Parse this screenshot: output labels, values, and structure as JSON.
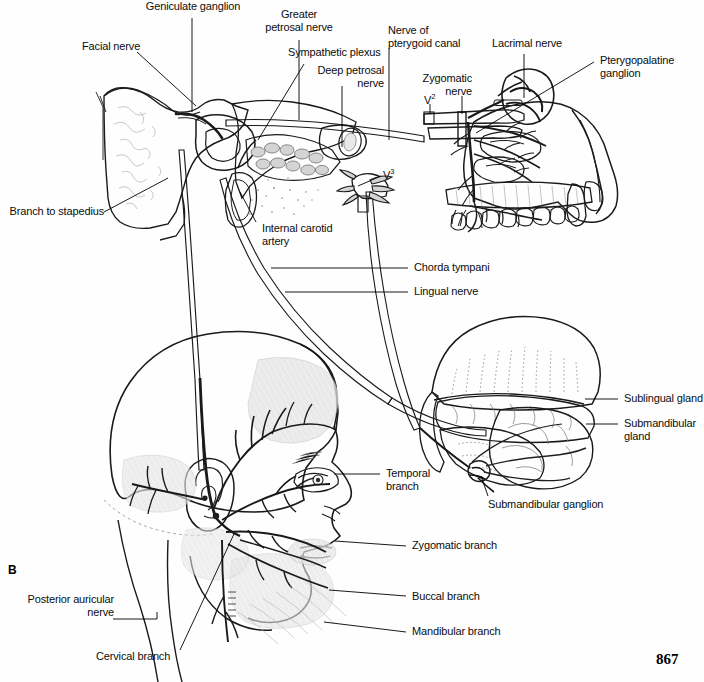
{
  "figure": {
    "panel_label": "B",
    "page_number": "867",
    "type": "anatomical-illustration"
  },
  "labels": {
    "facial_nerve": "Facial nerve",
    "geniculate_ganglion": "Geniculate ganglion",
    "greater_petrosal_nerve": "Greater\npetrosal nerve",
    "sympathetic_plexus": "Sympathetic plexus",
    "deep_petrosal_nerve": "Deep petrosal\nnerve",
    "nerve_of_pterygoid_canal": "Nerve of\npterygoid canal",
    "lacrimal_nerve": "Lacrimal nerve",
    "pterygopalatine_ganglion": "Pterygopalatine\nganglion",
    "zygomatic_nerve": "Zygomatic\nnerve",
    "v2": "V",
    "v2_sup": "2",
    "v3": "V",
    "v3_sup": "3",
    "branch_to_stapedius": "Branch to stapedius",
    "internal_carotid_artery": "Internal carotid\nartery",
    "chorda_tympani": "Chorda tympani",
    "lingual_nerve": "Lingual nerve",
    "sublingual_gland": "Sublingual gland",
    "submandibular_gland": "Submandibular\ngland",
    "submandibular_ganglion": "Submandibular ganglion",
    "temporal_branch": "Temporal\nbranch",
    "zygomatic_branch": "Zygomatic branch",
    "buccal_branch": "Buccal branch",
    "mandibular_branch": "Mandibular branch",
    "cervical_branch": "Cervical branch",
    "posterior_auricular_nerve": "Posterior auricular\nnerve"
  },
  "colors": {
    "background": "#fefefe",
    "ink": "#1a1a1a",
    "leader": "#000000",
    "tissue_light": "#f0f0f0",
    "tissue_mid": "#d8d8d8",
    "tissue_dark": "#b5b5b5",
    "nerve_fill": "#c9c9c9",
    "text": "#0d0d0d"
  }
}
